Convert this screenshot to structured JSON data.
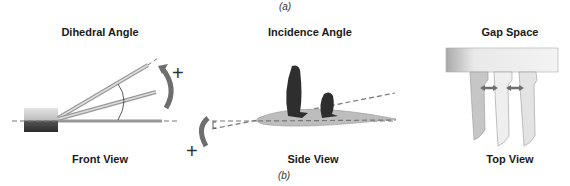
{
  "figure": {
    "label_top": "(a)",
    "label_bottom": "(b)"
  },
  "panels": [
    {
      "title": "Dihedral Angle",
      "caption": "Front View",
      "sign_symbol": "+",
      "icon": "dihedral-angle-diagram-icon"
    },
    {
      "title": "Incidence Angle",
      "caption": "Side View",
      "sign_symbol": "+",
      "icon": "incidence-angle-diagram-icon"
    },
    {
      "title": "Gap Space",
      "caption": "Top View",
      "icon": "gap-space-diagram-icon"
    }
  ],
  "colors": {
    "dark_fin": "#2e2e2e",
    "arrow_gray": "#6e6e6e",
    "board_gray": "#c8c8c8",
    "dash_gray": "#777777"
  }
}
